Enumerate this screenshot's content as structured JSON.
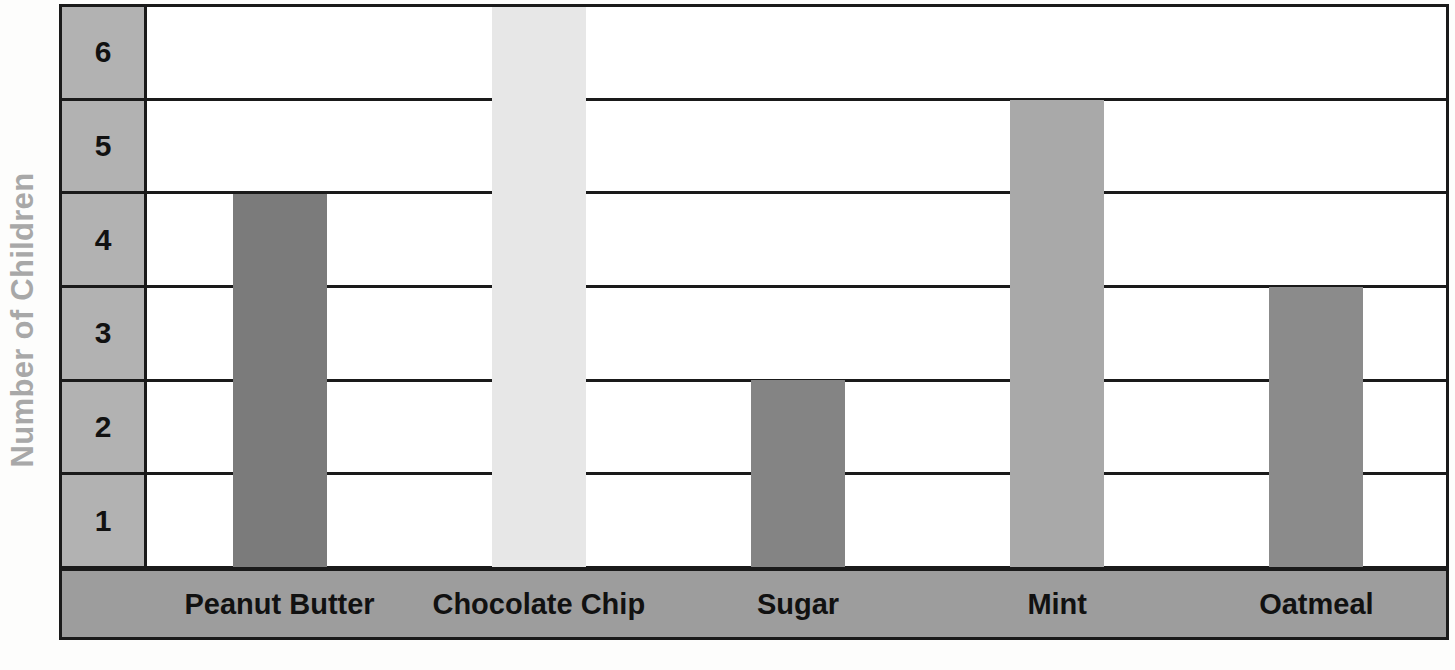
{
  "chart_data": {
    "type": "bar",
    "title": "",
    "xlabel": "",
    "ylabel": "Number of Children",
    "categories": [
      "Peanut Butter",
      "Chocolate Chip",
      "Sugar",
      "Mint",
      "Oatmeal"
    ],
    "values": [
      4,
      6,
      2,
      5,
      3
    ],
    "ylim": [
      0,
      6
    ],
    "yticks": [
      "6",
      "5",
      "4",
      "3",
      "2",
      "1"
    ],
    "grid": true,
    "legend": "none",
    "orientation": "vertical",
    "bar_colors": [
      "#7b7b7b",
      "#e7e7e7",
      "#848484",
      "#a9a9a9",
      "#8b8b8b"
    ],
    "series": [
      {
        "name": "Number of Children",
        "points": [
          {
            "category": "Peanut Butter",
            "value": 4,
            "color": "#7b7b7b"
          },
          {
            "category": "Chocolate Chip",
            "value": 6,
            "color": "#e7e7e7"
          },
          {
            "category": "Sugar",
            "value": 2,
            "color": "#848484"
          },
          {
            "category": "Mint",
            "value": 5,
            "color": "#a9a9a9"
          },
          {
            "category": "Oatmeal",
            "value": 3,
            "color": "#8b8b8b"
          }
        ]
      }
    ]
  },
  "axes": {
    "y": {
      "title": "Number of Children",
      "title_color": "#a8a8a8",
      "tick_band_color": "#b2b2b2",
      "ticks": [
        {
          "label": "6"
        },
        {
          "label": "5"
        },
        {
          "label": "4"
        },
        {
          "label": "3"
        },
        {
          "label": "2"
        },
        {
          "label": "1"
        }
      ]
    },
    "x": {
      "band_color": "#9d9d9d",
      "ticks": [
        {
          "label": "Peanut Butter"
        },
        {
          "label": "Chocolate Chip"
        },
        {
          "label": "Sugar"
        },
        {
          "label": "Mint"
        },
        {
          "label": "Oatmeal"
        }
      ]
    }
  },
  "style": {
    "gridline_color": "#1a1a1a",
    "plot_background": "#ffffff",
    "page_background": "#fdfdfc"
  }
}
